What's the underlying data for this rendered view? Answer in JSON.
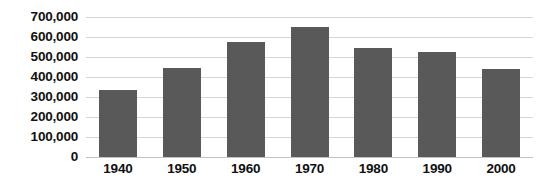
{
  "chart_data": {
    "type": "bar",
    "title": "",
    "xlabel": "",
    "ylabel": "",
    "categories": [
      "1940",
      "1950",
      "1960",
      "1970",
      "1980",
      "1990",
      "2000"
    ],
    "values": [
      335000,
      445000,
      575000,
      650000,
      545000,
      525000,
      440000
    ],
    "ylim": [
      0,
      700000
    ],
    "ytick_labels": [
      "700,000",
      "600,000",
      "500,000",
      "400,000",
      "300,000",
      "200,000",
      "100,000",
      "0"
    ],
    "ytick_values": [
      700000,
      600000,
      500000,
      400000,
      300000,
      200000,
      100000,
      0
    ],
    "grid": true,
    "legend": null,
    "series_color": "#595959",
    "gridline_color": "#d4d4d4",
    "background_color": "#ffffff",
    "text_color": "#111111"
  }
}
